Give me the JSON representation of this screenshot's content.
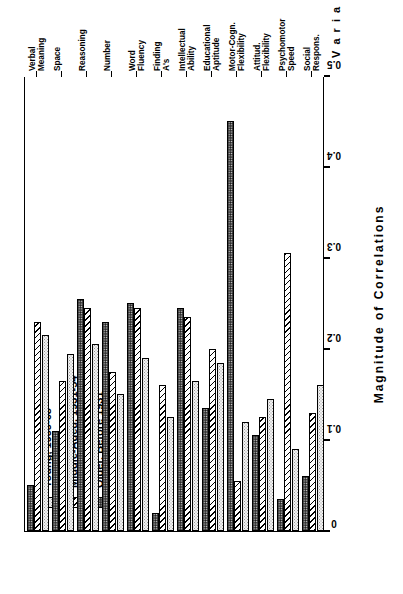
{
  "chart_data": {
    "type": "bar",
    "orientation": "horizontal",
    "title": "",
    "xlabel": "Magnitude  of  Correlations",
    "ylabel": "Variable",
    "xlim": [
      0,
      0.5
    ],
    "xticks": [
      "0",
      "0.1",
      "0.2",
      "0.3",
      "0.4",
      "0.5"
    ],
    "xtick_values": [
      0,
      0.1,
      0.2,
      0.3,
      0.4,
      0.5
    ],
    "grid": false,
    "legend_position": "upper-left",
    "categories": [
      {
        "line1": "Verbal",
        "line2": "Meaning"
      },
      {
        "line1": "Space",
        "line2": ""
      },
      {
        "line1": "Reasoning",
        "line2": ""
      },
      {
        "line1": "Number",
        "line2": ""
      },
      {
        "line1": "Word",
        "line2": "Fluency"
      },
      {
        "line1": "Finding",
        "line2": "A's"
      },
      {
        "line1": "Intellectual",
        "line2": "Ability"
      },
      {
        "line1": "Educational",
        "line2": "Aptitude"
      },
      {
        "line1": "Motor-Cogn.",
        "line2": "Flexibility"
      },
      {
        "line1": "Attitud.",
        "line2": "Flexibility"
      },
      {
        "line1": "Psychomotor",
        "line2": "Speed"
      },
      {
        "line1": "Social",
        "line2": "Respons."
      }
    ],
    "series": [
      {
        "name": "Young,  1955-68",
        "key": "young",
        "pattern": "light-dotted",
        "values": [
          0.215,
          0.195,
          0.205,
          0.15,
          0.19,
          0.125,
          0.165,
          0.185,
          0.12,
          0.145,
          0.09,
          0.16
        ]
      },
      {
        "name": "Middle-Aged,  1931-54",
        "key": "middle",
        "pattern": "diagonal-hatch",
        "values": [
          0.23,
          0.165,
          0.245,
          0.175,
          0.245,
          0.16,
          0.235,
          0.2,
          0.055,
          0.125,
          0.305,
          0.13
        ]
      },
      {
        "name": "Older,  Before 1931",
        "key": "older",
        "pattern": "dark-dense",
        "values": [
          0.05,
          0.11,
          0.255,
          0.23,
          0.25,
          0.02,
          0.245,
          0.135,
          0.45,
          0.105,
          0.035,
          0.06
        ]
      }
    ]
  },
  "legend": {
    "items": [
      {
        "label": "Young,  1955-68",
        "swatch": "light-dotted"
      },
      {
        "label": "Middle-Aged,  1931-54",
        "swatch": "diagonal-hatch"
      },
      {
        "label": "Older,  Before 1931",
        "swatch": "dark-dense"
      }
    ]
  },
  "axes": {
    "x_title": "Magnitude  of  Correlations",
    "y_title": "V a r i a b l e"
  },
  "colors": {
    "axis": "#000000",
    "young_fill": "#f2f2f2",
    "middle_fill": "#ffffff",
    "older_fill": "#4a4a4a",
    "background": "#ffffff"
  }
}
